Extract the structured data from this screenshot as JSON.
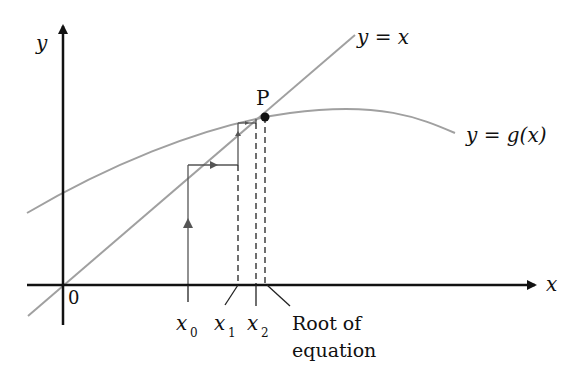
{
  "diagram": {
    "axes": {
      "x_label": "x",
      "y_label": "y",
      "origin_label": "0"
    },
    "curves": {
      "line_label": "y = x",
      "curve_label": "y = g(x)"
    },
    "point": {
      "label": "P"
    },
    "ticks": [
      {
        "name": "x0",
        "base": "x",
        "sub": "0"
      },
      {
        "name": "x1",
        "base": "x",
        "sub": "1"
      },
      {
        "name": "x2",
        "base": "x",
        "sub": "2"
      }
    ],
    "root_label_line1": "Root of",
    "root_label_line2": "equation",
    "colors": {
      "axis": "#111111",
      "curve": "#a0a0a0",
      "cobweb": "#555555"
    }
  }
}
